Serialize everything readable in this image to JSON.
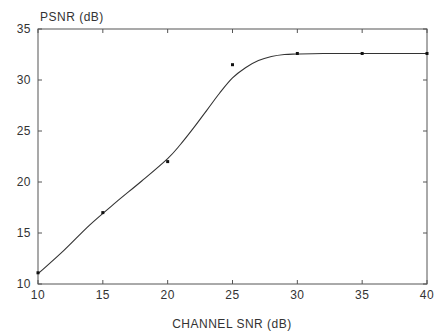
{
  "chart_data": {
    "type": "line",
    "title": "",
    "xlabel": "CHANNEL SNR (dB)",
    "ylabel": "PSNR (dB)",
    "xlim": [
      10,
      40
    ],
    "ylim": [
      10,
      35
    ],
    "x_ticks": [
      10,
      15,
      20,
      25,
      30,
      35,
      40
    ],
    "y_ticks": [
      10,
      15,
      20,
      25,
      30,
      35
    ],
    "grid": false,
    "legend": null,
    "series": [
      {
        "name": "measured",
        "kind": "scatter",
        "x": [
          10,
          15,
          20,
          25,
          30,
          35,
          40
        ],
        "y": [
          11.1,
          17.0,
          22.0,
          31.5,
          32.6,
          32.6,
          32.6
        ]
      },
      {
        "name": "fitted curve",
        "kind": "line",
        "x": [
          10,
          12,
          14,
          16,
          18,
          20,
          21,
          22,
          23,
          24,
          25,
          26,
          27,
          28,
          29,
          30,
          32,
          35,
          40
        ],
        "y": [
          11.0,
          13.3,
          15.8,
          18.0,
          20.1,
          22.3,
          23.7,
          25.3,
          27.0,
          28.7,
          30.2,
          31.2,
          31.9,
          32.3,
          32.5,
          32.55,
          32.6,
          32.6,
          32.6
        ]
      }
    ]
  }
}
